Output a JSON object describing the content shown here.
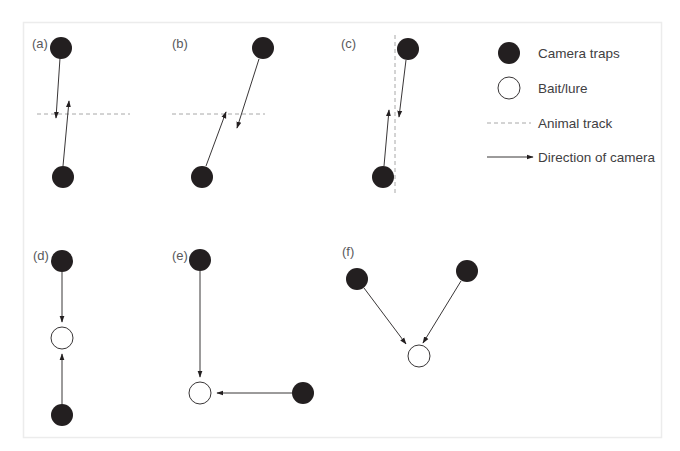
{
  "figure": {
    "panels": [
      {
        "id": "a",
        "label": "(a)",
        "description": "Two opposing cameras offset across a horizontal animal track"
      },
      {
        "id": "b",
        "label": "(b)",
        "description": "Two cameras diagonally offset across a horizontal animal track"
      },
      {
        "id": "c",
        "label": "(c)",
        "description": "Two cameras facing each other along a vertical animal track"
      },
      {
        "id": "d",
        "label": "(d)",
        "description": "Two cameras facing a bait/lure from opposite sides"
      },
      {
        "id": "e",
        "label": "(e)",
        "description": "Two cameras at right angles facing a bait/lure"
      },
      {
        "id": "f",
        "label": "(f)",
        "description": "Two cameras converging on a bait/lure at an angle"
      }
    ],
    "legend": {
      "items": [
        {
          "symbol": "filled-circle",
          "label": "Camera traps"
        },
        {
          "symbol": "open-circle",
          "label": "Bait/lure"
        },
        {
          "symbol": "dashed-line",
          "label": "Animal track"
        },
        {
          "symbol": "arrow",
          "label": "Direction of camera"
        }
      ]
    },
    "colors": {
      "camera_trap": "#231f20",
      "track": "#a8a8a8",
      "frame_border": "#ececec",
      "label_text": "#58595b"
    }
  }
}
